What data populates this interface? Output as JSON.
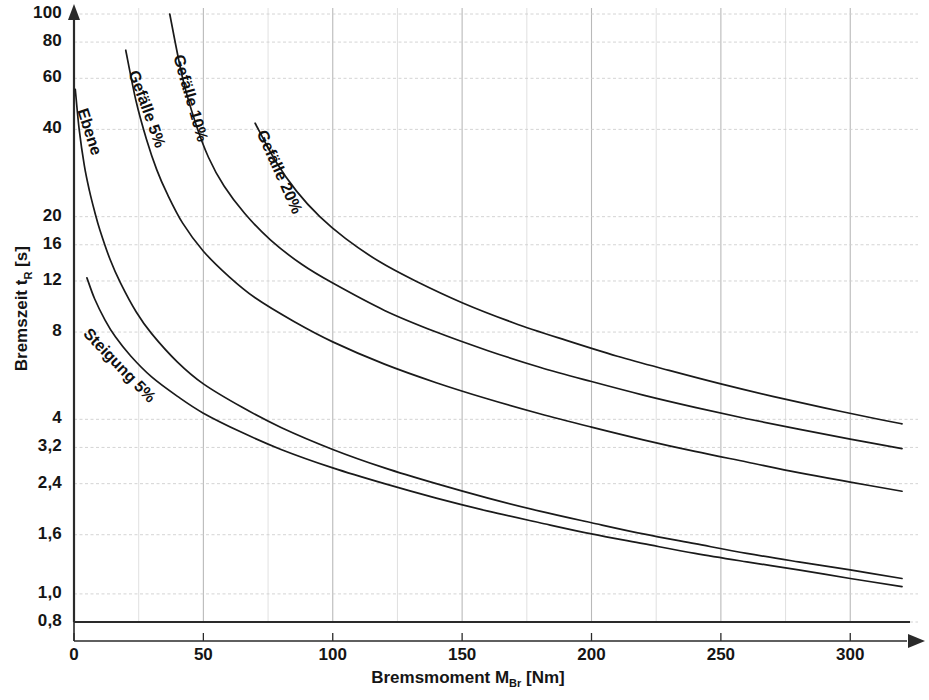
{
  "chart_data": {
    "type": "line",
    "title": "",
    "xlabel": "Bremsmoment M_Br [Nm]",
    "ylabel": "Bremszeit t_R [s]",
    "xlabel_main": "Bremsmoment M",
    "xlabel_sub": "Br",
    "xlabel_unit": " [Nm]",
    "ylabel_main": "Bremszeit t",
    "ylabel_sub": "R",
    "ylabel_unit": " [s]",
    "xscale": "linear",
    "yscale": "log",
    "xlim": [
      0,
      320
    ],
    "ylim": [
      0.8,
      100
    ],
    "grid": true,
    "grid_color": "#c9c9c9",
    "legend": "inline-curve-labels",
    "x_ticks": [
      0,
      50,
      100,
      150,
      200,
      250,
      300
    ],
    "x_tick_labels": [
      "0",
      "50",
      "100",
      "150",
      "200",
      "250",
      "300"
    ],
    "x_minor_step": 25,
    "y_ticks": [
      0.8,
      1.0,
      1.6,
      2.4,
      3.2,
      4,
      8,
      12,
      16,
      20,
      40,
      60,
      80,
      100
    ],
    "y_tick_labels": [
      "0,8",
      "1,0",
      "1,6",
      "2,4",
      "3,2",
      "4",
      "8",
      "12",
      "16",
      "20",
      "40",
      "60",
      "80",
      "100"
    ],
    "series": [
      {
        "name": "Ebene",
        "label": "Ebene",
        "color": "#1a1a1a",
        "label_angle": 72,
        "points": [
          [
            0.5,
            55
          ],
          [
            2,
            40
          ],
          [
            4,
            30
          ],
          [
            6,
            24.5
          ],
          [
            8,
            20.8
          ],
          [
            10,
            18.0
          ],
          [
            14,
            14.2
          ],
          [
            18,
            11.8
          ],
          [
            24,
            9.4
          ],
          [
            30,
            7.9
          ],
          [
            40,
            6.3
          ],
          [
            50,
            5.3
          ],
          [
            65,
            4.4
          ],
          [
            80,
            3.75
          ],
          [
            100,
            3.15
          ],
          [
            120,
            2.72
          ],
          [
            140,
            2.4
          ],
          [
            160,
            2.14
          ],
          [
            180,
            1.93
          ],
          [
            200,
            1.76
          ],
          [
            220,
            1.61
          ],
          [
            240,
            1.49
          ],
          [
            260,
            1.38
          ],
          [
            280,
            1.29
          ],
          [
            300,
            1.21
          ],
          [
            320,
            1.13
          ]
        ]
      },
      {
        "name": "Steigung 5%",
        "label": "Steigung 5%",
        "color": "#1a1a1a",
        "label_angle": 46,
        "points": [
          [
            5,
            12.3
          ],
          [
            8,
            10.4
          ],
          [
            12,
            8.8
          ],
          [
            16,
            7.7
          ],
          [
            22,
            6.6
          ],
          [
            30,
            5.6
          ],
          [
            40,
            4.8
          ],
          [
            50,
            4.2
          ],
          [
            65,
            3.6
          ],
          [
            80,
            3.15
          ],
          [
            100,
            2.72
          ],
          [
            120,
            2.4
          ],
          [
            140,
            2.14
          ],
          [
            160,
            1.93
          ],
          [
            180,
            1.76
          ],
          [
            200,
            1.61
          ],
          [
            220,
            1.49
          ],
          [
            240,
            1.38
          ],
          [
            260,
            1.29
          ],
          [
            280,
            1.21
          ],
          [
            300,
            1.13
          ],
          [
            320,
            1.06
          ]
        ]
      },
      {
        "name": "Gefälle 5%",
        "label": "Gefälle 5%",
        "color": "#1a1a1a",
        "label_angle": 70,
        "points": [
          [
            20,
            75
          ],
          [
            24,
            50
          ],
          [
            28,
            37
          ],
          [
            32,
            29
          ],
          [
            36,
            24
          ],
          [
            42,
            19
          ],
          [
            50,
            15.2
          ],
          [
            60,
            12.4
          ],
          [
            70,
            10.5
          ],
          [
            85,
            8.7
          ],
          [
            100,
            7.4
          ],
          [
            120,
            6.2
          ],
          [
            140,
            5.35
          ],
          [
            160,
            4.7
          ],
          [
            180,
            4.18
          ],
          [
            200,
            3.76
          ],
          [
            220,
            3.4
          ],
          [
            240,
            3.1
          ],
          [
            260,
            2.85
          ],
          [
            280,
            2.62
          ],
          [
            300,
            2.43
          ],
          [
            320,
            2.26
          ]
        ]
      },
      {
        "name": "Gefälle 10%",
        "label": "Gefälle 10%",
        "color": "#1a1a1a",
        "label_angle": 74,
        "points": [
          [
            37,
            100
          ],
          [
            42,
            60
          ],
          [
            47,
            42
          ],
          [
            52,
            32
          ],
          [
            58,
            25.5
          ],
          [
            66,
            20.5
          ],
          [
            76,
            16.6
          ],
          [
            88,
            13.7
          ],
          [
            100,
            11.8
          ],
          [
            120,
            9.5
          ],
          [
            140,
            8.0
          ],
          [
            160,
            6.9
          ],
          [
            180,
            6.05
          ],
          [
            200,
            5.4
          ],
          [
            220,
            4.85
          ],
          [
            240,
            4.4
          ],
          [
            260,
            4.02
          ],
          [
            280,
            3.7
          ],
          [
            300,
            3.42
          ],
          [
            320,
            3.17
          ]
        ]
      },
      {
        "name": "Gefälle 20%",
        "label": "Gefälle 20%",
        "color": "#1a1a1a",
        "label_angle": 66,
        "points": [
          [
            70,
            42
          ],
          [
            78,
            31
          ],
          [
            86,
            24.5
          ],
          [
            95,
            20.0
          ],
          [
            105,
            16.8
          ],
          [
            118,
            14.0
          ],
          [
            132,
            12.0
          ],
          [
            150,
            10.1
          ],
          [
            170,
            8.6
          ],
          [
            190,
            7.5
          ],
          [
            210,
            6.6
          ],
          [
            230,
            5.9
          ],
          [
            250,
            5.3
          ],
          [
            270,
            4.8
          ],
          [
            290,
            4.38
          ],
          [
            310,
            4.02
          ],
          [
            320,
            3.86
          ]
        ]
      }
    ]
  }
}
